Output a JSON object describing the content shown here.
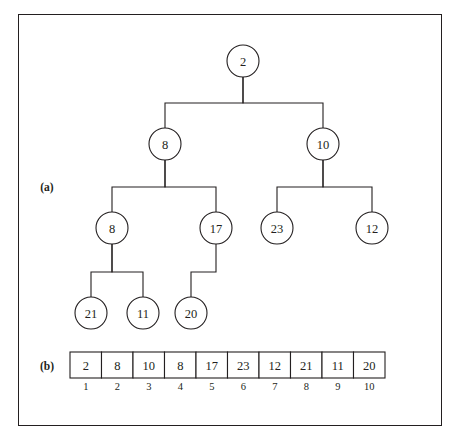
{
  "figure": {
    "background": "#ffffff",
    "ink": "#231f20",
    "frame": {
      "x": 18,
      "y": 14,
      "width": 424,
      "height": 412
    }
  },
  "parts": [
    {
      "id": "part-a",
      "label": "(a)",
      "x": 47,
      "y": 187
    },
    {
      "id": "part-b",
      "label": "(b)",
      "x": 47,
      "y": 366
    }
  ],
  "tree": {
    "radius": 16,
    "nodes": [
      {
        "id": "n1",
        "label": "2",
        "cx": 243,
        "cy": 61
      },
      {
        "id": "n2",
        "label": "8",
        "cx": 165,
        "cy": 144
      },
      {
        "id": "n3",
        "label": "10",
        "cx": 323,
        "cy": 144
      },
      {
        "id": "n4",
        "label": "8",
        "cx": 112,
        "cy": 228
      },
      {
        "id": "n5",
        "label": "17",
        "cx": 216,
        "cy": 228
      },
      {
        "id": "n6",
        "label": "23",
        "cx": 277,
        "cy": 228
      },
      {
        "id": "n7",
        "label": "12",
        "cx": 372,
        "cy": 228
      },
      {
        "id": "n8",
        "label": "21",
        "cx": 91,
        "cy": 313
      },
      {
        "id": "n9",
        "label": "11",
        "cx": 143,
        "cy": 313
      },
      {
        "id": "n10",
        "label": "20",
        "cx": 191,
        "cy": 313
      }
    ],
    "edges": [
      {
        "from": "n1",
        "to": "n2",
        "bus_y": 103
      },
      {
        "from": "n1",
        "to": "n3",
        "bus_y": 103
      },
      {
        "from": "n2",
        "to": "n4",
        "bus_y": 187
      },
      {
        "from": "n2",
        "to": "n5",
        "bus_y": 187
      },
      {
        "from": "n3",
        "to": "n6",
        "bus_y": 187
      },
      {
        "from": "n3",
        "to": "n7",
        "bus_y": 187
      },
      {
        "from": "n4",
        "to": "n8",
        "bus_y": 272
      },
      {
        "from": "n4",
        "to": "n9",
        "bus_y": 272
      },
      {
        "from": "n5",
        "to": "n10",
        "bus_y": 272
      }
    ]
  },
  "array": {
    "x": 70,
    "y": 352,
    "cell_width": 31.5,
    "cell_height": 26,
    "index_y": 386,
    "values": [
      "2",
      "8",
      "10",
      "8",
      "17",
      "23",
      "12",
      "21",
      "11",
      "20"
    ],
    "indices": [
      "1",
      "2",
      "3",
      "4",
      "5",
      "6",
      "7",
      "8",
      "9",
      "10"
    ]
  }
}
